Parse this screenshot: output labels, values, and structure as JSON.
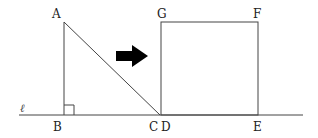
{
  "diagram": {
    "type": "geometry",
    "line": {
      "label": "ℓ"
    },
    "points": {
      "A": "A",
      "B": "B",
      "C": "C",
      "D": "D",
      "E": "E",
      "F": "F",
      "G": "G"
    },
    "shapes": {
      "triangle": "ABC",
      "right_angle_at": "B",
      "square": "DEFG"
    },
    "arrow": {
      "direction": "right",
      "color": "#000000"
    },
    "colors": {
      "stroke": "#333333",
      "background": "#ffffff"
    }
  }
}
